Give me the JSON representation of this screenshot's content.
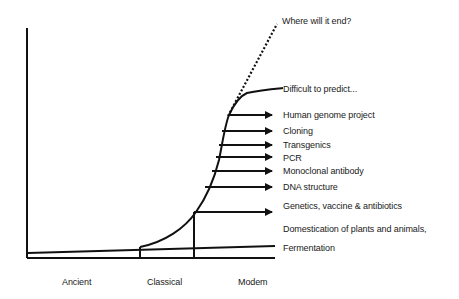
{
  "diagram": {
    "type": "growth-curve",
    "title": "",
    "x_axis": {
      "labels": [
        "Ancient",
        "Classical",
        "Modern"
      ],
      "label_display": [
        "Ancient",
        "Classical",
        "Modem"
      ]
    },
    "annotations": {
      "future_dotted": "Where will it end?",
      "future_solid": "Difficult to predict...",
      "milestones": [
        "Human genome project",
        "Cloning",
        "Transgenics",
        "PCR",
        "Monoclonal antibody",
        "DNA structure",
        "Genetics, vaccine & antibiotics"
      ],
      "early_1": "Domestication of plants and animals,",
      "early_2": "Fermentation"
    },
    "colors": {
      "line": "#111111",
      "text": "#1a1a1a",
      "background": "#ffffff"
    }
  }
}
